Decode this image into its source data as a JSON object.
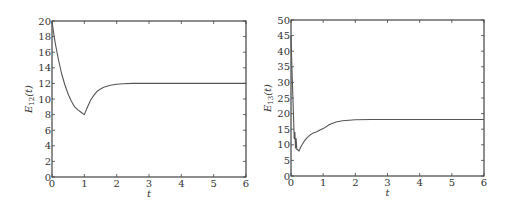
{
  "chart_data": [
    {
      "type": "line",
      "title": "",
      "xlabel": "t",
      "ylabel": "E_12(t)",
      "ylabel_main": "E",
      "ylabel_sub": "12",
      "ylabel_tail": "(t)",
      "xlim": [
        0,
        6
      ],
      "ylim": [
        0,
        20
      ],
      "xticks": [
        "0",
        "1",
        "2",
        "3",
        "4",
        "5",
        "6"
      ],
      "yticks": [
        "0",
        "2",
        "4",
        "6",
        "8",
        "10",
        "12",
        "14",
        "16",
        "18",
        "20"
      ],
      "grid": false,
      "legend": null,
      "series": [
        {
          "name": "E12",
          "x": [
            0,
            0.05,
            0.1,
            0.2,
            0.3,
            0.4,
            0.5,
            0.6,
            0.7,
            0.8,
            0.9,
            1.0,
            1.1,
            1.2,
            1.3,
            1.4,
            1.5,
            1.6,
            1.8,
            2.0,
            2.2,
            2.5,
            3.0,
            4.0,
            5.0,
            6.0
          ],
          "values": [
            20,
            18.5,
            17.2,
            15.0,
            13.2,
            11.8,
            10.6,
            9.7,
            9.0,
            8.6,
            8.3,
            8.0,
            9.0,
            9.9,
            10.5,
            11.0,
            11.3,
            11.5,
            11.75,
            11.9,
            11.95,
            12.0,
            12.0,
            12.0,
            12.0,
            12.0
          ]
        }
      ]
    },
    {
      "type": "line",
      "title": "",
      "xlabel": "t",
      "ylabel": "E_13(t)",
      "ylabel_main": "E",
      "ylabel_sub": "13",
      "ylabel_tail": "(t)",
      "xlim": [
        0,
        6
      ],
      "ylim": [
        0,
        50
      ],
      "xticks": [
        "0",
        "1",
        "2",
        "3",
        "4",
        "5",
        "6"
      ],
      "yticks": [
        "0",
        "5",
        "10",
        "15",
        "20",
        "25",
        "30",
        "35",
        "40",
        "45",
        "50"
      ],
      "grid": false,
      "legend": null,
      "series": [
        {
          "name": "E13",
          "x": [
            0,
            0.02,
            0.05,
            0.08,
            0.1,
            0.12,
            0.14,
            0.16,
            0.18,
            0.2,
            0.25,
            0.3,
            0.4,
            0.5,
            0.6,
            0.7,
            0.8,
            0.9,
            1.0,
            1.2,
            1.4,
            1.6,
            1.8,
            2.0,
            2.5,
            3.0,
            4.0,
            5.0,
            6.0
          ],
          "values": [
            45,
            38,
            28,
            18,
            12,
            14,
            9,
            12,
            8.5,
            8.5,
            8.0,
            9.2,
            11.0,
            12.3,
            13.2,
            13.8,
            14.2,
            14.7,
            15.2,
            16.5,
            17.3,
            17.7,
            17.9,
            18.0,
            18.1,
            18.1,
            18.1,
            18.1,
            18.1
          ]
        }
      ]
    }
  ]
}
